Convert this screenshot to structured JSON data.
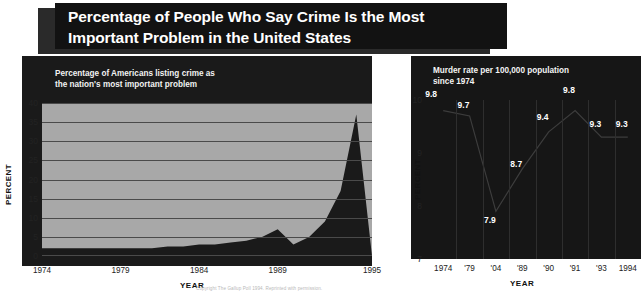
{
  "title": {
    "line1": "Percentage of People Who Say Crime Is the Most",
    "line2": "Important Problem in the United States"
  },
  "footer_note": "Copyright The Gallup Poll 1994. Reprinted with permission.",
  "left_chart": {
    "caption_line1": "Percentage of Americans listing crime as",
    "caption_line2": "the nation's most important problem",
    "ylabel": "PERCENT",
    "xlabel": "YEAR"
  },
  "right_chart": {
    "caption_line1": "Murder rate per 100,000 population",
    "caption_line2": "since 1974",
    "ylabel": "PERCENT",
    "xlabel": "YEAR"
  },
  "chart_data": [
    {
      "type": "area",
      "title": "Percentage of Americans listing crime as the nation's most important problem",
      "xlabel": "YEAR",
      "ylabel": "PERCENT",
      "xlim": [
        1974,
        1995
      ],
      "ylim": [
        0,
        40
      ],
      "xticks": [
        "1974",
        "1979",
        "1984",
        "1989",
        "1995"
      ],
      "xtick_values": [
        1974,
        1979,
        1984,
        1989,
        1995
      ],
      "yticks": [
        "0",
        "5",
        "10",
        "15",
        "20",
        "25",
        "30",
        "35",
        "40"
      ],
      "ytick_values": [
        0,
        5,
        10,
        15,
        20,
        25,
        30,
        35,
        40
      ],
      "grid": true,
      "legend": "none",
      "area_color": "#1a1a1a",
      "plot_bg": "#a8a8a8",
      "x": [
        1974,
        1975,
        1976,
        1977,
        1978,
        1979,
        1980,
        1981,
        1982,
        1983,
        1984,
        1985,
        1986,
        1987,
        1988,
        1989,
        1990,
        1991,
        1992,
        1993,
        1994,
        1995
      ],
      "values": [
        2,
        2,
        2,
        2,
        2,
        2,
        2,
        2,
        2.5,
        2.5,
        3,
        3,
        3.5,
        4,
        5,
        7,
        3,
        5,
        9,
        17,
        37,
        0
      ]
    },
    {
      "type": "line",
      "title": "Murder rate per 100,000 population since 1974",
      "xlabel": "YEAR",
      "ylabel": "PERCENT",
      "xlim": [
        0,
        7
      ],
      "ylim": [
        7,
        10
      ],
      "xticks": [
        "1974",
        "'79",
        "'04",
        "'89",
        "'90",
        "'91",
        "'93",
        "1994"
      ],
      "yticks": [
        "7",
        "8",
        "9",
        "10"
      ],
      "ytick_values": [
        7,
        8,
        9,
        10
      ],
      "grid": true,
      "legend": "none",
      "plot_bg": "#161616",
      "label_color": "#ffffff",
      "categories": [
        "1974",
        "'79",
        "'04",
        "'89",
        "'90",
        "'91",
        "'93",
        "1994"
      ],
      "values": [
        9.8,
        9.7,
        7.9,
        8.7,
        9.4,
        9.8,
        9.3,
        9.3
      ],
      "data_labels": [
        "9.8",
        "9.7",
        "7.9",
        "8.7",
        "9.4",
        "9.8",
        "9.3",
        "9.3"
      ]
    }
  ]
}
